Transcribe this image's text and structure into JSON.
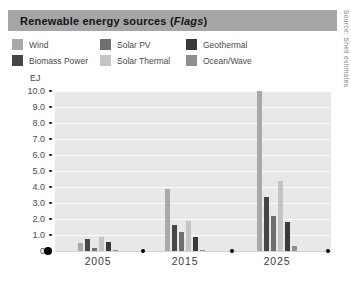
{
  "header": {
    "title_prefix": "Renewable energy sources (",
    "title_italic": "Flags",
    "title_suffix": ")"
  },
  "source_note": "Source: Shell estimates",
  "legend": {
    "items": [
      {
        "label": "Wind",
        "color": "#a9a9a9"
      },
      {
        "label": "Solar PV",
        "color": "#6f6f6f"
      },
      {
        "label": "Geothermal",
        "color": "#393939"
      },
      {
        "label": "Biomass Power",
        "color": "#464646"
      },
      {
        "label": "Solar Thermal",
        "color": "#c4c4c4"
      },
      {
        "label": "Ocean/Wave",
        "color": "#8e8e8e"
      }
    ]
  },
  "axis": {
    "unit_label": "EJ",
    "zero_label": "0"
  },
  "chart_data": {
    "type": "bar",
    "title": "Renewable energy sources (Flags)",
    "categories": [
      "2005",
      "2015",
      "2025"
    ],
    "series": [
      {
        "name": "Wind",
        "color": "#a9a9a9",
        "values": [
          0.5,
          3.85,
          10.0
        ]
      },
      {
        "name": "Biomass Power",
        "color": "#464646",
        "values": [
          0.75,
          1.6,
          3.4
        ]
      },
      {
        "name": "Solar PV",
        "color": "#6f6f6f",
        "values": [
          0.2,
          1.2,
          2.2
        ]
      },
      {
        "name": "Solar Thermal",
        "color": "#c4c4c4",
        "values": [
          0.9,
          1.9,
          4.4
        ]
      },
      {
        "name": "Geothermal",
        "color": "#393939",
        "values": [
          0.55,
          0.85,
          1.8
        ]
      },
      {
        "name": "Ocean/Wave",
        "color": "#8e8e8e",
        "values": [
          0.05,
          0.05,
          0.3
        ]
      }
    ],
    "xlabel": "",
    "ylabel": "EJ",
    "ylim": [
      0,
      10
    ],
    "ytick_step": 1.0,
    "grid": true,
    "legend_position": "top"
  }
}
